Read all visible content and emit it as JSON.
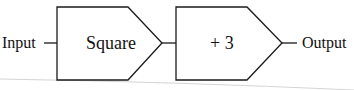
{
  "diagram": {
    "type": "block-flow",
    "input_label": "Input",
    "output_label": "Output",
    "blocks": [
      {
        "label": "Square"
      },
      {
        "label": "+ 3"
      }
    ],
    "colors": {
      "stroke": "#1a1a1a",
      "background": "#ffffff",
      "page_rule": "#c8c8c8"
    }
  }
}
